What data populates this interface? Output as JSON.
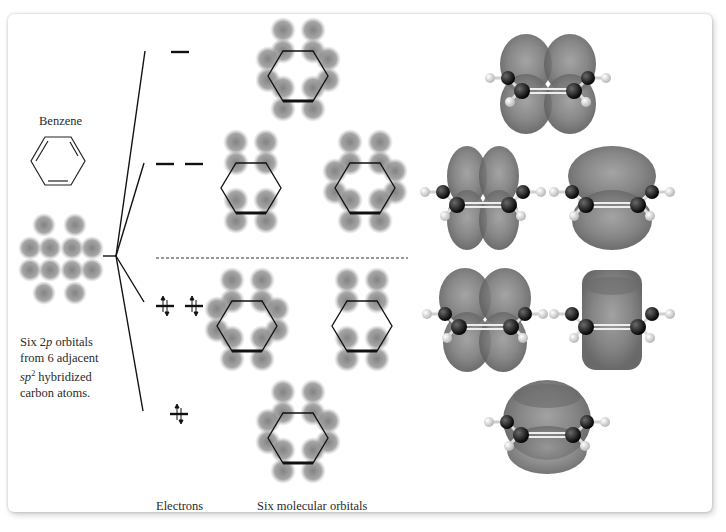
{
  "figure": {
    "benzene_label": "Benzene",
    "atomic_orbitals_caption": {
      "line1_prefix": "Six 2",
      "line1_italic": "p",
      "line1_suffix": " orbitals",
      "line2": "from 6 adjacent",
      "line3_italic": "sp",
      "line3_sup": "2",
      "line3_suffix": " hybridized",
      "line4": "carbon atoms."
    },
    "electrons_label": "Electrons",
    "molecular_orbitals_label": "Six molecular orbitals",
    "energy_levels": [
      {
        "name": "antibonding-highest",
        "count": 1,
        "electrons": 0
      },
      {
        "name": "antibonding-degenerate",
        "count": 2,
        "electrons": 0
      },
      {
        "name": "bonding-degenerate",
        "count": 2,
        "electrons": 4
      },
      {
        "name": "bonding-lowest",
        "count": 1,
        "electrons": 2
      }
    ],
    "colors": {
      "lobe": "#8a8a8a",
      "line": "#111111",
      "carbon": "#111111",
      "hydrogen": "#e6e6e6",
      "surface": "#7a7a7a"
    }
  }
}
